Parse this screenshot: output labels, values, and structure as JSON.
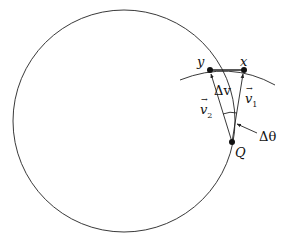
{
  "diagram": {
    "title": "",
    "labels": {
      "y": "y",
      "x": "x",
      "Q": "Q",
      "delta_v": "Δv",
      "v1": "v",
      "v1_sub": "1",
      "v2": "v",
      "v2_sub": "2",
      "delta_theta": "Δθ",
      "vec_arrow": "→"
    },
    "colors": {
      "stroke": "#222222",
      "background": "#ffffff"
    }
  }
}
